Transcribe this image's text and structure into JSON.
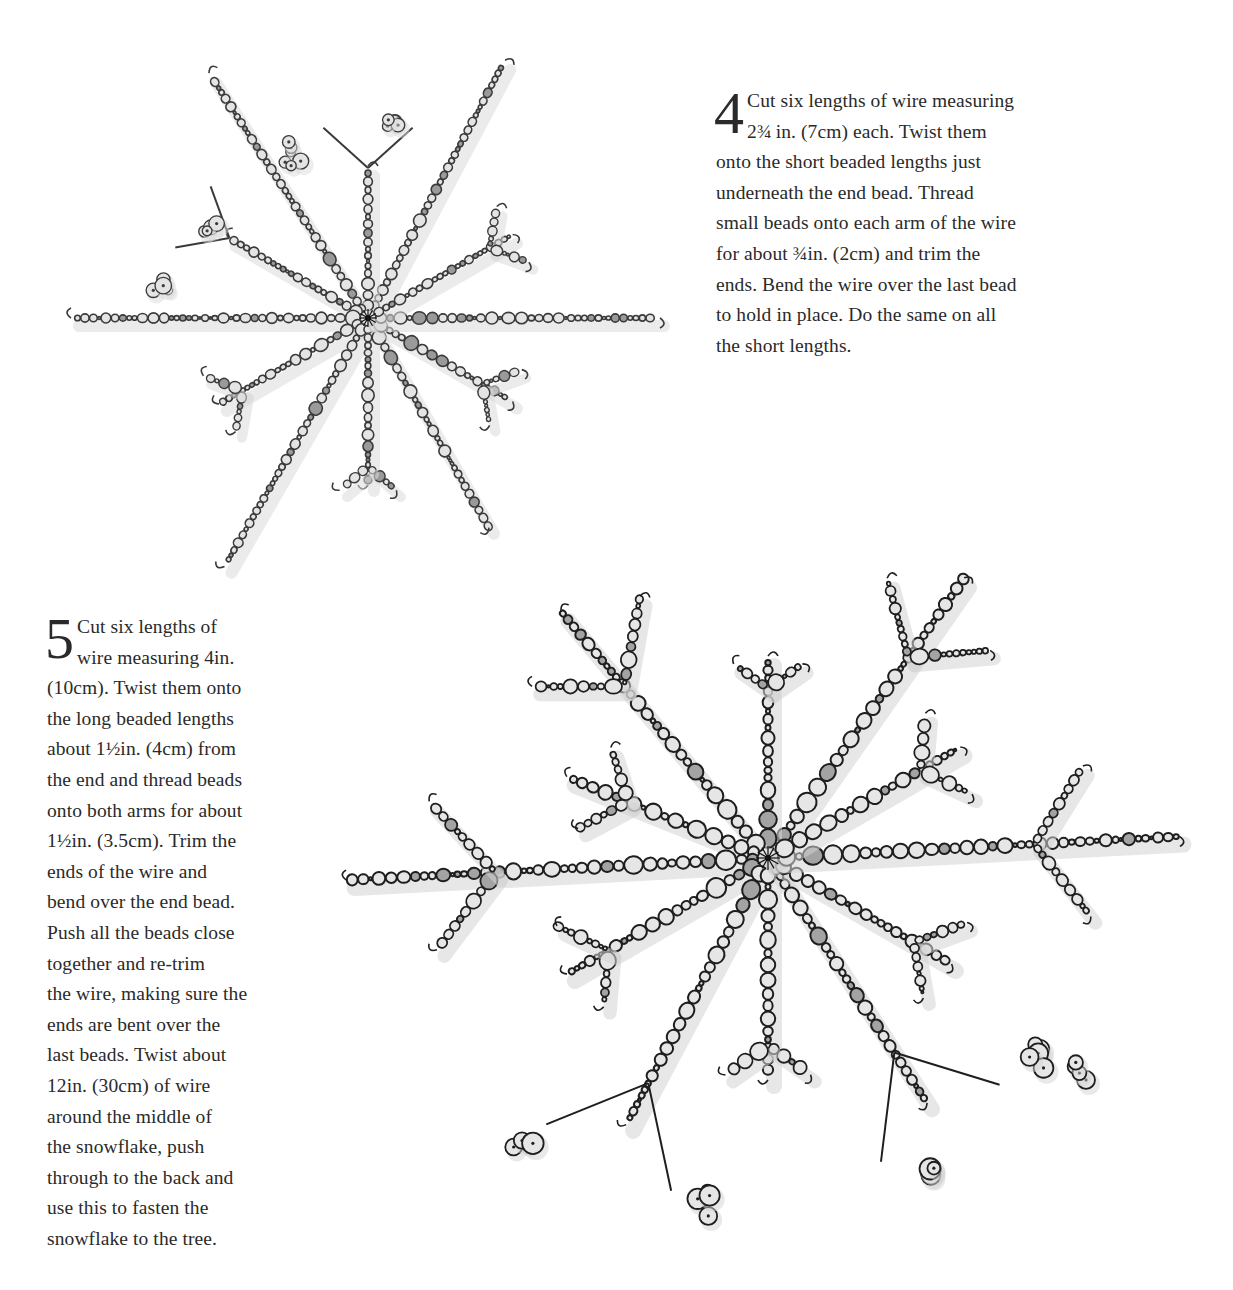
{
  "steps": [
    {
      "number": "4",
      "lines": [
        "Cut six lengths of wire measuring",
        "2¾ in. (7cm) each. Twist them",
        "onto the short beaded lengths just",
        "underneath the end bead. Thread",
        "small beads onto each arm of the wire",
        "for about ¾in. (2cm) and trim the",
        "ends. Bend the wire over the last bead",
        "to hold in place. Do the same on all",
        "the short lengths."
      ]
    },
    {
      "number": "5",
      "lines": [
        "Cut six lengths of",
        "wire measuring 4in.",
        "(10cm). Twist them onto",
        "the long beaded lengths",
        "about 1½in. (4cm) from",
        "the end and thread beads",
        "onto both arms for about",
        "1½in. (3.5cm). Trim the",
        "ends of the wire and",
        "bend over the end bead.",
        "Push all the beads close",
        "together and re-trim",
        "the wire, making sure the",
        "ends are bent over the",
        "last beads. Twist about",
        "12in. (30cm) of wire",
        "around the middle of",
        "the snowflake, push",
        "through to the back and",
        "use this to fasten the",
        "snowflake to the tree."
      ]
    }
  ],
  "illustrations": [
    {
      "name": "small-snowflake",
      "center": [
        368,
        318
      ],
      "stroke": "#3a3a3a",
      "bead_fill": "#e4e4e4",
      "accent_fill": "#9a9a9a",
      "shadow": "#dcdcdc",
      "bead_scale": 0.75,
      "arms": [
        {
          "angle": -62,
          "length": 290,
          "branches": []
        },
        {
          "angle": -90,
          "length": 150,
          "branches": [
            {
              "at": 1.0,
              "len": 60,
              "spread": 48,
              "wire": true
            }
          ]
        },
        {
          "angle": -123,
          "length": 290,
          "branches": []
        },
        {
          "angle": -150,
          "length": 160,
          "branches": [
            {
              "at": 1.0,
              "len": 55,
              "spread": 40,
              "wire": true
            }
          ]
        },
        {
          "angle": 180,
          "length": 295,
          "branches": []
        },
        {
          "angle": 150,
          "length": 170,
          "branches": [
            {
              "at": 0.85,
              "len": 40,
              "spread": 50,
              "wire": false
            }
          ]
        },
        {
          "angle": 120,
          "length": 285,
          "branches": []
        },
        {
          "angle": 90,
          "length": 165,
          "branches": [
            {
              "at": 0.9,
              "len": 35,
              "spread": 50,
              "wire": false
            }
          ]
        },
        {
          "angle": 60,
          "length": 240,
          "branches": []
        },
        {
          "angle": 30,
          "length": 165,
          "branches": [
            {
              "at": 0.8,
              "len": 40,
              "spread": 50,
              "wire": false
            }
          ]
        },
        {
          "angle": 0,
          "length": 290,
          "branches": []
        },
        {
          "angle": -30,
          "length": 165,
          "branches": [
            {
              "at": 0.85,
              "len": 40,
              "spread": 50,
              "wire": false
            }
          ]
        }
      ],
      "clusters": [
        [
          290,
          155
        ],
        [
          388,
          120
        ],
        [
          215,
          230
        ],
        [
          158,
          285
        ]
      ]
    },
    {
      "name": "large-snowflake",
      "center": [
        768,
        858
      ],
      "stroke": "#1e1e1e",
      "bead_fill": "#e6e6e6",
      "accent_fill": "#a3a3a3",
      "shadow": "#d4d4d4",
      "bead_scale": 1.0,
      "arms": [
        {
          "angle": -55,
          "length": 340,
          "branches": [
            {
              "at": 0.72,
              "len": 80,
              "spread": 50,
              "wire": false
            }
          ]
        },
        {
          "angle": -90,
          "length": 200,
          "branches": [
            {
              "at": 0.85,
              "len": 40,
              "spread": 55,
              "wire": false
            }
          ]
        },
        {
          "angle": -130,
          "length": 320,
          "branches": [
            {
              "at": 0.7,
              "len": 90,
              "spread": 50,
              "wire": false
            }
          ]
        },
        {
          "angle": -158,
          "length": 215,
          "branches": [
            {
              "at": 0.7,
              "len": 55,
              "spread": 50,
              "wire": false
            }
          ]
        },
        {
          "angle": 177,
          "length": 420,
          "branches": [
            {
              "at": 0.65,
              "len": 95,
              "spread": 50,
              "wire": false
            }
          ]
        },
        {
          "angle": 150,
          "length": 230,
          "branches": [
            {
              "at": 0.8,
              "len": 55,
              "spread": 55,
              "wire": false
            }
          ]
        },
        {
          "angle": 118,
          "length": 300,
          "branches": [
            {
              "at": 0.85,
              "len": 110,
              "spread": 40,
              "wire": true
            }
          ]
        },
        {
          "angle": 90,
          "length": 220,
          "branches": [
            {
              "at": 0.85,
              "len": 50,
              "spread": 55,
              "wire": false
            }
          ]
        },
        {
          "angle": 57,
          "length": 290,
          "branches": [
            {
              "at": 0.8,
              "len": 110,
              "spread": 40,
              "wire": true
            }
          ]
        },
        {
          "angle": 30,
          "length": 210,
          "branches": [
            {
              "at": 0.8,
              "len": 55,
              "spread": 50,
              "wire": false
            }
          ]
        },
        {
          "angle": -3,
          "length": 410,
          "branches": [
            {
              "at": 0.65,
              "len": 90,
              "spread": 55,
              "wire": false
            }
          ]
        },
        {
          "angle": -30,
          "length": 220,
          "branches": [
            {
              "at": 0.8,
              "len": 55,
              "spread": 55,
              "wire": false
            }
          ]
        }
      ],
      "clusters": [
        [
          530,
          1150
        ],
        [
          700,
          1200
        ],
        [
          930,
          1175
        ],
        [
          1040,
          1060
        ],
        [
          1080,
          1070
        ]
      ]
    }
  ]
}
